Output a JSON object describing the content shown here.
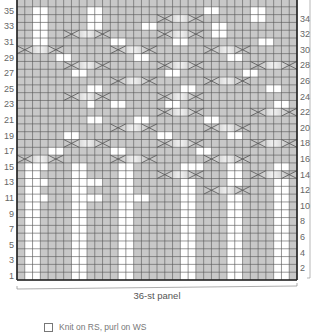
{
  "chart_title": "",
  "panel_label": "36-st panel",
  "legend": [
    {
      "symbol": "white-square",
      "label": "Knit on RS, purl on WS"
    }
  ],
  "grid": {
    "columns": 36,
    "rows": 36,
    "left_row_labels": [
      "35",
      "33",
      "31",
      "29",
      "27",
      "25",
      "23",
      "21",
      "19",
      "17",
      "15",
      "13",
      "11",
      "9",
      "7",
      "5",
      "3",
      "1"
    ],
    "right_row_labels": [
      "34",
      "32",
      "30",
      "28",
      "26",
      "24",
      "22",
      "20",
      "18",
      "16",
      "14",
      "12",
      "10",
      "8",
      "6",
      "4",
      "2"
    ],
    "colors": {
      "gray": "#c8c8c8",
      "white": "#ffffff",
      "line": "#555555",
      "border": "#222222",
      "cable_light": "#f2f2f2",
      "cable_dark": "#a9a9a9"
    },
    "white_columns_bottom": [
      2,
      3,
      8,
      9,
      14,
      15,
      22,
      23,
      28,
      29,
      34,
      35
    ],
    "bottom_section_rows": [
      1,
      15
    ]
  },
  "chart_data": {
    "type": "table",
    "xlabel": "36-st panel",
    "ylabel": "Rows",
    "rows_1_to_15_white_columns": [
      2,
      3,
      8,
      9,
      14,
      15,
      22,
      23,
      28,
      29,
      34,
      35
    ],
    "cables": [
      {
        "row": 16,
        "col_start": 1,
        "width": 6
      },
      {
        "row": 16,
        "col_start": 13,
        "width": 6
      },
      {
        "row": 16,
        "col_start": 25,
        "width": 6
      },
      {
        "row": 14,
        "col_start": 19,
        "width": 6
      },
      {
        "row": 14,
        "col_start": 31,
        "width": 6
      },
      {
        "row": 12,
        "col_start": 25,
        "width": 6
      },
      {
        "row": 18,
        "col_start": 7,
        "width": 6
      },
      {
        "row": 18,
        "col_start": 19,
        "width": 6
      },
      {
        "row": 18,
        "col_start": 31,
        "width": 6
      },
      {
        "row": 20,
        "col_start": 13,
        "width": 6
      },
      {
        "row": 20,
        "col_start": 25,
        "width": 6
      },
      {
        "row": 22,
        "col_start": 19,
        "width": 6
      },
      {
        "row": 22,
        "col_start": 31,
        "width": 6
      },
      {
        "row": 24,
        "col_start": 7,
        "width": 6
      },
      {
        "row": 24,
        "col_start": 19,
        "width": 6
      },
      {
        "row": 26,
        "col_start": 13,
        "width": 6
      },
      {
        "row": 26,
        "col_start": 25,
        "width": 6
      },
      {
        "row": 28,
        "col_start": 7,
        "width": 6
      },
      {
        "row": 28,
        "col_start": 19,
        "width": 6
      },
      {
        "row": 28,
        "col_start": 31,
        "width": 6
      },
      {
        "row": 30,
        "col_start": 1,
        "width": 6
      },
      {
        "row": 30,
        "col_start": 13,
        "width": 6
      },
      {
        "row": 30,
        "col_start": 25,
        "width": 6
      },
      {
        "row": 32,
        "col_start": 7,
        "width": 6
      },
      {
        "row": 32,
        "col_start": 19,
        "width": 6
      },
      {
        "row": 34,
        "col_start": 19,
        "width": 6
      }
    ],
    "white_cells_upper": [
      [
        35,
        3
      ],
      [
        35,
        4
      ],
      [
        35,
        10
      ],
      [
        35,
        11
      ],
      [
        35,
        25
      ],
      [
        35,
        26
      ],
      [
        35,
        31
      ],
      [
        35,
        32
      ],
      [
        34,
        3
      ],
      [
        34,
        4
      ],
      [
        34,
        10
      ],
      [
        34,
        11
      ],
      [
        34,
        31
      ],
      [
        34,
        32
      ],
      [
        33,
        3
      ],
      [
        33,
        4
      ],
      [
        33,
        10
      ],
      [
        33,
        11
      ],
      [
        33,
        17
      ],
      [
        33,
        18
      ],
      [
        33,
        26
      ],
      [
        33,
        27
      ],
      [
        32,
        3
      ],
      [
        32,
        4
      ],
      [
        32,
        26
      ],
      [
        32,
        27
      ],
      [
        31,
        3
      ],
      [
        31,
        4
      ],
      [
        31,
        13
      ],
      [
        31,
        14
      ],
      [
        31,
        21
      ],
      [
        31,
        22
      ],
      [
        31,
        32
      ],
      [
        31,
        33
      ],
      [
        29,
        6
      ],
      [
        29,
        7
      ],
      [
        29,
        16
      ],
      [
        29,
        17
      ],
      [
        29,
        28
      ],
      [
        29,
        29
      ],
      [
        27,
        8
      ],
      [
        27,
        9
      ],
      [
        27,
        20
      ],
      [
        27,
        21
      ],
      [
        27,
        30
      ],
      [
        27,
        31
      ],
      [
        25,
        10
      ],
      [
        25,
        11
      ],
      [
        25,
        22
      ],
      [
        25,
        23
      ],
      [
        25,
        33
      ],
      [
        25,
        34
      ],
      [
        23,
        10
      ],
      [
        23,
        13
      ],
      [
        23,
        14
      ],
      [
        23,
        20
      ],
      [
        23,
        21
      ],
      [
        23,
        34
      ],
      [
        23,
        35
      ],
      [
        21,
        10
      ],
      [
        21,
        11
      ],
      [
        21,
        16
      ],
      [
        21,
        17
      ],
      [
        21,
        25
      ],
      [
        21,
        26
      ],
      [
        19,
        7
      ],
      [
        19,
        8
      ],
      [
        19,
        19
      ],
      [
        19,
        20
      ],
      [
        19,
        28
      ],
      [
        19,
        29
      ],
      [
        17,
        5
      ],
      [
        17,
        6
      ],
      [
        17,
        13
      ],
      [
        17,
        14
      ],
      [
        17,
        24
      ],
      [
        17,
        25
      ],
      [
        15,
        3
      ],
      [
        15,
        4
      ],
      [
        15,
        23
      ],
      [
        15,
        24
      ],
      [
        15,
        34
      ],
      [
        15,
        35
      ],
      [
        13,
        3
      ],
      [
        13,
        4
      ],
      [
        13,
        10
      ],
      [
        13,
        11
      ],
      [
        13,
        28
      ],
      [
        13,
        29
      ],
      [
        11,
        3
      ],
      [
        11,
        4
      ],
      [
        11,
        10
      ],
      [
        11,
        11
      ],
      [
        11,
        16
      ],
      [
        11,
        17
      ],
      [
        11,
        22
      ],
      [
        11,
        23
      ],
      [
        11,
        34
      ],
      [
        11,
        35
      ]
    ]
  }
}
